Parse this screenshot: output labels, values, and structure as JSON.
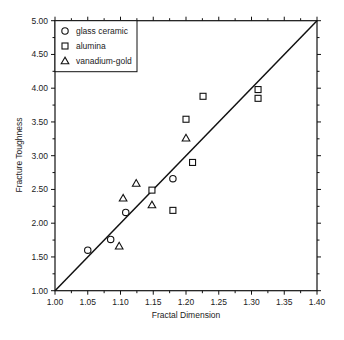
{
  "chart_data": {
    "type": "scatter",
    "title": "",
    "xlabel": "Fractal Dimension",
    "ylabel": "Fracture Toughness",
    "xlim": [
      1.0,
      1.4
    ],
    "ylim": [
      1.0,
      5.0
    ],
    "x_ticks": [
      "1.00",
      "1.05",
      "1.10",
      "1.15",
      "1.20",
      "1.25",
      "1.30",
      "1.35",
      "1.40"
    ],
    "y_ticks": [
      "1.00",
      "1.50",
      "2.00",
      "2.50",
      "3.00",
      "3.50",
      "4.00",
      "4.50",
      "5.00"
    ],
    "grid": false,
    "legend_position": "upper-left",
    "series": [
      {
        "name": "glass ceramic",
        "marker": "circle",
        "points": [
          [
            1.05,
            1.6
          ],
          [
            1.085,
            1.76
          ],
          [
            1.108,
            2.16
          ],
          [
            1.18,
            2.66
          ]
        ]
      },
      {
        "name": "alumina",
        "marker": "square",
        "points": [
          [
            1.148,
            2.49
          ],
          [
            1.18,
            2.19
          ],
          [
            1.21,
            2.9
          ],
          [
            1.2,
            3.54
          ],
          [
            1.226,
            3.88
          ],
          [
            1.31,
            3.98
          ],
          [
            1.31,
            3.85
          ]
        ]
      },
      {
        "name": "vanadium-gold",
        "marker": "triangle",
        "points": [
          [
            1.098,
            1.66
          ],
          [
            1.104,
            2.37
          ],
          [
            1.124,
            2.59
          ],
          [
            1.148,
            2.27
          ],
          [
            1.2,
            3.26
          ]
        ]
      }
    ],
    "reference_line": {
      "from": [
        1.0,
        1.0
      ],
      "to": [
        1.4,
        5.0
      ],
      "label": ""
    }
  },
  "legend": {
    "items": [
      {
        "label": "glass ceramic",
        "marker": "circle"
      },
      {
        "label": "alumina",
        "marker": "square"
      },
      {
        "label": "vanadium-gold",
        "marker": "triangle"
      }
    ]
  },
  "axes": {
    "xlabel": "Fractal Dimension",
    "ylabel": "Fracture Toughness"
  }
}
